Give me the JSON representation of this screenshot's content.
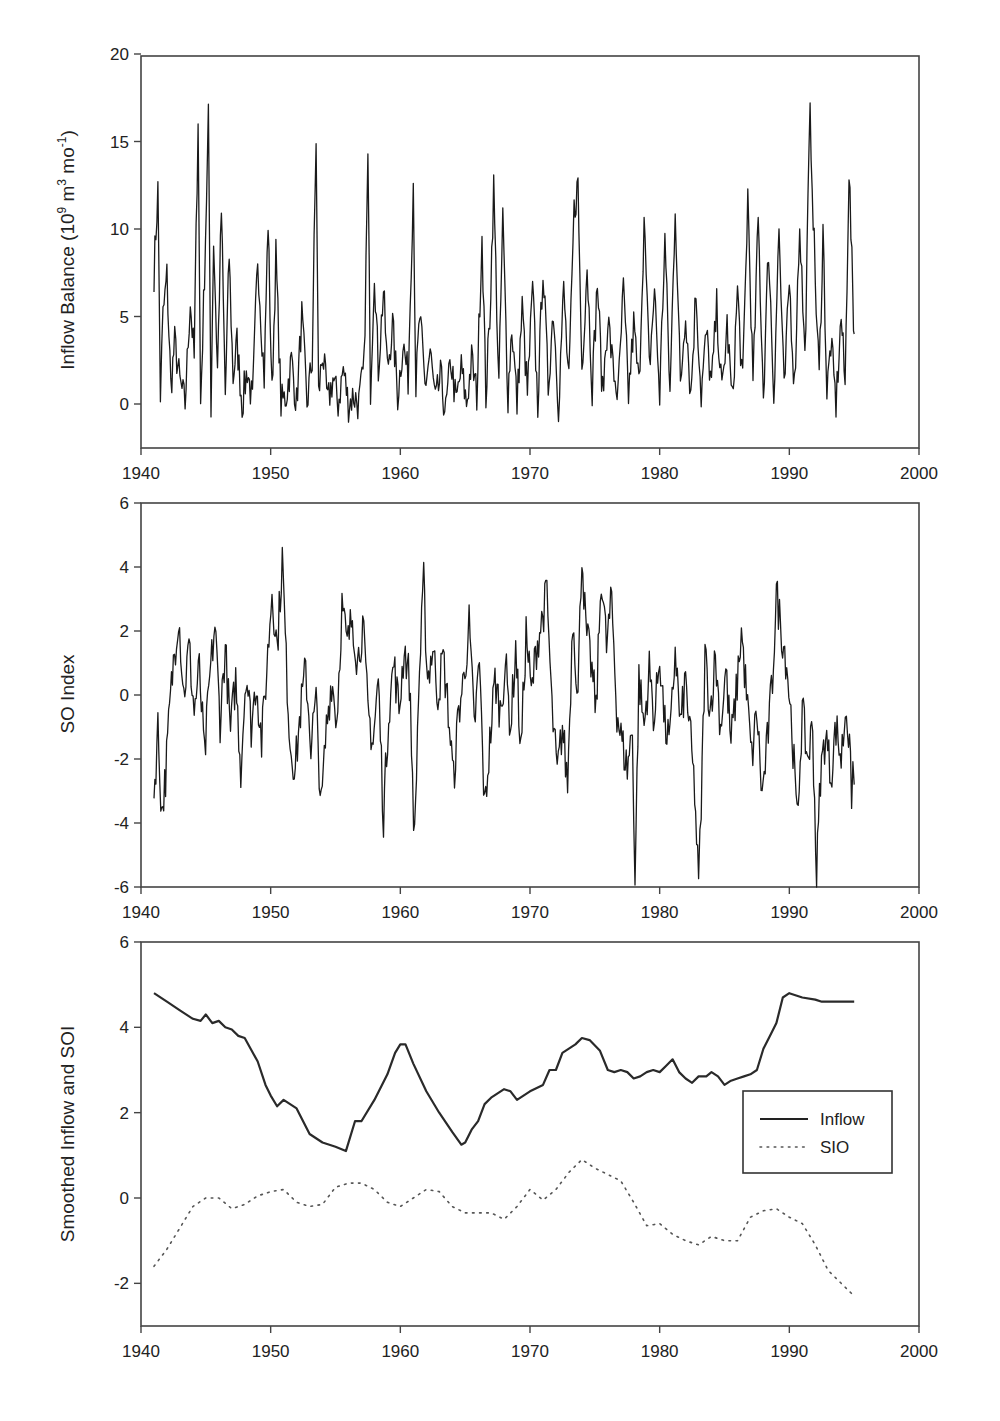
{
  "figure": {
    "panels": [
      {
        "id": "inflow",
        "ylabel": "Inflow Balance (10^9 m^3 mo^-1)",
        "ylabel_parts": {
          "base": "Inflow Balance (10",
          "sup1": "9",
          "mid": " m",
          "sup2": "3",
          "mid2": " mo",
          "sup3": "-1",
          "end": ")"
        },
        "yticks": [
          "20",
          "15",
          "10",
          "5",
          "0"
        ],
        "xticks": [
          "1940",
          "1950",
          "1960",
          "1970",
          "1980",
          "1990",
          "2000"
        ]
      },
      {
        "id": "soi",
        "ylabel": "SO Index",
        "yticks": [
          "6",
          "4",
          "2",
          "0",
          "-2",
          "-4",
          "-6"
        ],
        "xticks": [
          "1940",
          "1950",
          "1960",
          "1970",
          "1980",
          "1990",
          "2000"
        ]
      },
      {
        "id": "smoothed",
        "ylabel": "Smoothed Inflow and SOI",
        "yticks": [
          "6",
          "4",
          "2",
          "0",
          "-2"
        ],
        "xticks": [
          "1940",
          "1950",
          "1960",
          "1970",
          "1980",
          "1990",
          "2000"
        ],
        "legend": {
          "inflow": "Inflow",
          "sio": "SIO"
        }
      }
    ]
  },
  "chart_data": [
    {
      "type": "line",
      "title": "",
      "xlabel": "",
      "ylabel": "Inflow Balance (10^9 m^3 mo^-1)",
      "xlim": [
        1940,
        2000
      ],
      "ylim": [
        -2.5,
        20
      ],
      "grid": false,
      "legend": null,
      "series": [
        {
          "name": "Inflow Balance (monthly, approx. envelope)",
          "x": [
            1941.0,
            1941.3,
            1941.5,
            1941.7,
            1942.0,
            1942.3,
            1942.6,
            1943.0,
            1943.4,
            1943.8,
            1944.1,
            1944.4,
            1944.6,
            1944.9,
            1945.2,
            1945.4,
            1945.6,
            1945.9,
            1946.2,
            1946.5,
            1946.8,
            1947.1,
            1947.4,
            1947.8,
            1948.2,
            1948.6,
            1949.0,
            1949.5,
            1949.8,
            1950.1,
            1950.4,
            1950.8,
            1951.2,
            1951.6,
            1952.0,
            1952.4,
            1952.8,
            1953.2,
            1953.5,
            1953.7,
            1954.0,
            1954.4,
            1954.8,
            1955.2,
            1955.6,
            1956.0,
            1956.4,
            1956.8,
            1957.2,
            1957.5,
            1957.7,
            1958.0,
            1958.3,
            1958.7,
            1959.0,
            1959.4,
            1959.8,
            1960.2,
            1960.6,
            1961.0,
            1961.2,
            1961.5,
            1961.9,
            1962.3,
            1962.7,
            1963.1,
            1963.5,
            1963.9,
            1964.3,
            1964.7,
            1965.1,
            1965.5,
            1965.9,
            1966.3,
            1966.6,
            1966.9,
            1967.2,
            1967.6,
            1967.9,
            1968.3,
            1968.6,
            1969.0,
            1969.4,
            1969.8,
            1970.2,
            1970.6,
            1971.0,
            1971.4,
            1971.8,
            1972.2,
            1972.6,
            1973.0,
            1973.4,
            1973.7,
            1974.0,
            1974.4,
            1974.8,
            1975.2,
            1975.6,
            1976.0,
            1976.4,
            1976.8,
            1977.2,
            1977.6,
            1978.0,
            1978.4,
            1978.8,
            1979.2,
            1979.6,
            1980.0,
            1980.4,
            1980.8,
            1981.2,
            1981.6,
            1982.0,
            1982.4,
            1982.8,
            1983.2,
            1983.6,
            1984.0,
            1984.4,
            1984.8,
            1985.2,
            1985.6,
            1986.0,
            1986.4,
            1986.8,
            1987.2,
            1987.6,
            1988.0,
            1988.4,
            1988.8,
            1989.2,
            1989.6,
            1990.0,
            1990.4,
            1990.8,
            1991.2,
            1991.6,
            1992.0,
            1992.3,
            1992.6,
            1992.9,
            1993.2,
            1993.6,
            1994.0,
            1994.3,
            1994.6,
            1994.9,
            1995.0
          ],
          "values": [
            7.5,
            12.2,
            0.5,
            5.0,
            7.3,
            1.0,
            3.5,
            1.2,
            0.0,
            6.0,
            2.5,
            16.5,
            0.0,
            7.5,
            16.2,
            0.0,
            9.5,
            2.0,
            11.0,
            0.5,
            8.5,
            1.5,
            3.5,
            0.0,
            2.0,
            0.0,
            8.5,
            1.5,
            10.5,
            0.5,
            8.5,
            0.0,
            0.5,
            2.5,
            0.0,
            5.0,
            0.0,
            2.5,
            15.2,
            0.5,
            3.0,
            0.0,
            1.5,
            0.0,
            2.0,
            0.0,
            0.5,
            0.0,
            2.0,
            13.8,
            1.0,
            7.8,
            2.0,
            6.5,
            2.0,
            4.5,
            0.5,
            3.5,
            1.5,
            12.8,
            1.0,
            5.0,
            1.0,
            3.0,
            0.0,
            1.5,
            -0.5,
            2.5,
            0.0,
            2.0,
            0.0,
            2.5,
            0.5,
            9.8,
            0.5,
            5.0,
            12.4,
            1.0,
            10.6,
            0.5,
            4.5,
            0.0,
            5.5,
            0.5,
            6.5,
            0.0,
            8.0,
            1.0,
            5.5,
            0.0,
            6.5,
            1.0,
            11.0,
            12.6,
            2.0,
            8.0,
            1.0,
            7.0,
            0.5,
            5.0,
            2.0,
            0.5,
            6.5,
            0.5,
            4.5,
            1.0,
            10.5,
            2.0,
            6.5,
            0.5,
            9.5,
            0.5,
            11.5,
            1.0,
            5.5,
            0.5,
            6.5,
            0.5,
            4.0,
            1.0,
            5.5,
            0.5,
            4.5,
            0.0,
            6.5,
            1.0,
            12.0,
            1.0,
            10.5,
            0.5,
            9.0,
            0.5,
            10.0,
            0.5,
            7.0,
            1.0,
            10.5,
            2.5,
            16.9,
            7.0,
            1.5,
            10.0,
            0.5,
            3.5,
            0.0,
            5.0,
            1.0,
            13.5,
            6.0,
            4.0
          ]
        }
      ],
      "notes": "Dense monthly series; major peaks ~16.5 (1944.5), ~16.2 (1945.3), ~15.2 (1953.6), ~13.8 (1957.6), ~12.9 (1961.1), ~12.5 (1968), ~12.6 (1973.7), ~16.9 (1992.3), ~13.5 (1994.9); floor near -1 in 1950s-1960s."
    },
    {
      "type": "line",
      "title": "",
      "xlabel": "",
      "ylabel": "SO Index",
      "xlim": [
        1940,
        2000
      ],
      "ylim": [
        -6,
        6
      ],
      "grid": false,
      "legend": null,
      "series": [
        {
          "name": "SO Index (monthly, approx.)",
          "x": [
            1941.0,
            1941.3,
            1941.6,
            1941.9,
            1942.2,
            1942.5,
            1942.9,
            1943.3,
            1943.7,
            1944.1,
            1944.5,
            1944.9,
            1945.3,
            1945.7,
            1946.1,
            1946.5,
            1946.9,
            1947.3,
            1947.7,
            1948.1,
            1948.5,
            1948.9,
            1949.3,
            1949.7,
            1950.1,
            1950.5,
            1950.9,
            1951.2,
            1951.5,
            1951.9,
            1952.3,
            1952.7,
            1953.1,
            1953.5,
            1953.9,
            1954.3,
            1954.7,
            1955.1,
            1955.5,
            1955.9,
            1956.3,
            1956.7,
            1957.1,
            1957.5,
            1957.9,
            1958.3,
            1958.7,
            1959.1,
            1959.5,
            1959.9,
            1960.3,
            1960.7,
            1961.1,
            1961.4,
            1961.8,
            1962.1,
            1962.5,
            1962.9,
            1963.3,
            1963.7,
            1964.1,
            1964.5,
            1964.9,
            1965.3,
            1965.7,
            1966.1,
            1966.5,
            1966.9,
            1967.3,
            1967.7,
            1968.1,
            1968.5,
            1968.9,
            1969.3,
            1969.7,
            1970.1,
            1970.5,
            1970.9,
            1971.3,
            1971.7,
            1972.1,
            1972.5,
            1972.9,
            1973.3,
            1973.7,
            1974.0,
            1974.3,
            1974.7,
            1975.1,
            1975.5,
            1975.9,
            1976.3,
            1976.7,
            1977.1,
            1977.5,
            1977.9,
            1978.1,
            1978.4,
            1978.8,
            1979.2,
            1979.6,
            1980.0,
            1980.4,
            1980.8,
            1981.2,
            1981.6,
            1982.0,
            1982.4,
            1982.7,
            1983.0,
            1983.2,
            1983.5,
            1983.9,
            1984.3,
            1984.7,
            1985.1,
            1985.5,
            1985.9,
            1986.3,
            1986.7,
            1987.1,
            1987.5,
            1987.9,
            1988.3,
            1988.7,
            1989.0,
            1989.4,
            1989.8,
            1990.2,
            1990.6,
            1991.0,
            1991.4,
            1991.8,
            1992.1,
            1992.4,
            1992.8,
            1993.2,
            1993.6,
            1994.0,
            1994.4,
            1994.8,
            1995.0
          ],
          "values": [
            -3.2,
            -1.0,
            -3.7,
            -2.5,
            -0.5,
            1.0,
            2.6,
            0.0,
            1.5,
            -0.5,
            0.8,
            -2.0,
            0.5,
            2.2,
            -0.8,
            1.5,
            -1.2,
            0.5,
            -2.3,
            0.8,
            -1.0,
            0.5,
            -1.5,
            0.8,
            3.3,
            1.5,
            4.3,
            1.0,
            -1.5,
            -2.3,
            -0.5,
            0.8,
            -1.5,
            -0.2,
            -3.6,
            -1.0,
            0.5,
            -0.8,
            2.8,
            1.5,
            2.5,
            1.0,
            2.2,
            -0.5,
            -1.5,
            0.5,
            -3.8,
            -0.5,
            1.0,
            -0.5,
            1.5,
            0.5,
            -4.6,
            0.0,
            3.5,
            0.5,
            1.5,
            0.0,
            1.2,
            -0.5,
            -2.7,
            -0.5,
            0.5,
            2.2,
            -1.0,
            1.0,
            -3.6,
            -1.5,
            0.5,
            -0.5,
            1.0,
            -1.0,
            1.5,
            -1.8,
            2.0,
            0.0,
            1.5,
            2.3,
            3.2,
            -0.5,
            -2.5,
            -1.0,
            -2.8,
            2.5,
            0.0,
            4.6,
            2.0,
            1.0,
            -0.5,
            3.8,
            1.5,
            3.0,
            -0.5,
            -1.5,
            -2.3,
            -1.0,
            -5.8,
            0.5,
            -1.0,
            0.8,
            -0.8,
            1.3,
            -1.0,
            -1.5,
            1.5,
            -1.0,
            0.5,
            -1.5,
            -3.0,
            -6.0,
            -3.5,
            1.3,
            -0.5,
            1.2,
            -1.0,
            0.8,
            -1.5,
            0.0,
            2.0,
            0.0,
            -2.0,
            -0.5,
            -3.2,
            -1.5,
            0.5,
            3.2,
            2.0,
            1.0,
            -1.0,
            -4.0,
            -0.5,
            -2.0,
            -1.0,
            -5.7,
            -2.5,
            -1.2,
            -2.5,
            -1.0,
            -2.0,
            -0.2,
            -3.0,
            -1.5,
            -2.8
          ]
        }
      ],
      "notes": "Extreme lows ~-5.8 (1978.1) and ~-6 (1983.2); highs ~4.3 (1951), ~4.6 (1974), ~3.8 (1975.9), ~3.2 (1989)."
    },
    {
      "type": "line",
      "title": "",
      "xlabel": "",
      "ylabel": "Smoothed Inflow and SOI",
      "xlim": [
        1940,
        2000
      ],
      "ylim": [
        -3,
        6
      ],
      "grid": false,
      "legend": {
        "position": "right-center, inside",
        "entries": [
          "Inflow",
          "SIO"
        ]
      },
      "series": [
        {
          "name": "Inflow",
          "style": "solid",
          "x": [
            1941.0,
            1942.0,
            1943.0,
            1944.0,
            1944.6,
            1945.0,
            1945.5,
            1946.0,
            1946.5,
            1947.0,
            1947.5,
            1948.0,
            1949.0,
            1949.6,
            1950.0,
            1950.5,
            1951.0,
            1952.0,
            1952.5,
            1953.0,
            1954.0,
            1955.0,
            1955.8,
            1956.5,
            1957.0,
            1958.0,
            1959.0,
            1959.6,
            1960.0,
            1960.4,
            1961.0,
            1962.0,
            1963.0,
            1964.0,
            1964.7,
            1965.0,
            1965.5,
            1966.0,
            1966.5,
            1967.0,
            1968.0,
            1968.5,
            1969.0,
            1969.5,
            1970.0,
            1971.0,
            1971.5,
            1972.0,
            1972.5,
            1973.0,
            1973.5,
            1974.0,
            1974.6,
            1975.4,
            1976.0,
            1976.5,
            1977.0,
            1977.5,
            1978.0,
            1978.5,
            1979.0,
            1979.5,
            1980.0,
            1980.5,
            1981.0,
            1981.5,
            1982.0,
            1982.5,
            1983.0,
            1983.6,
            1984.0,
            1984.5,
            1985.0,
            1985.5,
            1986.0,
            1986.5,
            1987.0,
            1987.5,
            1988.0,
            1988.5,
            1989.0,
            1989.5,
            1990.0,
            1991.0,
            1992.0,
            1992.5,
            1993.0,
            1994.0,
            1995.0
          ],
          "values": [
            4.8,
            4.6,
            4.4,
            4.2,
            4.15,
            4.3,
            4.1,
            4.15,
            4.0,
            3.95,
            3.8,
            3.75,
            3.2,
            2.65,
            2.4,
            2.15,
            2.3,
            2.1,
            1.8,
            1.5,
            1.3,
            1.2,
            1.1,
            1.8,
            1.8,
            2.3,
            2.9,
            3.4,
            3.6,
            3.6,
            3.15,
            2.5,
            2.0,
            1.55,
            1.25,
            1.3,
            1.6,
            1.8,
            2.2,
            2.35,
            2.55,
            2.5,
            2.3,
            2.4,
            2.5,
            2.65,
            3.0,
            3.0,
            3.4,
            3.5,
            3.6,
            3.75,
            3.7,
            3.45,
            3.0,
            2.95,
            3.0,
            2.95,
            2.8,
            2.85,
            2.95,
            3.0,
            2.95,
            3.1,
            3.25,
            2.95,
            2.8,
            2.7,
            2.85,
            2.85,
            2.95,
            2.85,
            2.65,
            2.75,
            2.8,
            2.85,
            2.9,
            3.0,
            3.5,
            3.8,
            4.1,
            4.7,
            4.8,
            4.7,
            4.65,
            4.6,
            4.6,
            4.6,
            4.6
          ]
        },
        {
          "name": "SIO",
          "style": "dotted",
          "x": [
            1941.0,
            1942.0,
            1943.0,
            1944.0,
            1945.0,
            1946.0,
            1947.0,
            1948.0,
            1949.0,
            1950.0,
            1951.0,
            1952.0,
            1953.0,
            1954.0,
            1955.0,
            1956.0,
            1957.0,
            1958.0,
            1959.0,
            1960.0,
            1961.0,
            1962.0,
            1963.0,
            1964.0,
            1965.0,
            1966.0,
            1967.0,
            1968.0,
            1969.0,
            1970.0,
            1971.0,
            1972.0,
            1973.0,
            1974.0,
            1975.0,
            1976.0,
            1977.0,
            1978.0,
            1979.0,
            1980.0,
            1981.0,
            1982.0,
            1983.0,
            1984.0,
            1985.0,
            1986.0,
            1987.0,
            1988.0,
            1989.0,
            1990.0,
            1991.0,
            1992.0,
            1993.0,
            1994.0,
            1995.0
          ],
          "values": [
            -1.6,
            -1.2,
            -0.7,
            -0.2,
            0.0,
            0.0,
            -0.25,
            -0.15,
            0.05,
            0.15,
            0.2,
            -0.1,
            -0.2,
            -0.15,
            0.25,
            0.35,
            0.35,
            0.2,
            -0.1,
            -0.2,
            0.0,
            0.2,
            0.15,
            -0.2,
            -0.35,
            -0.35,
            -0.35,
            -0.5,
            -0.2,
            0.2,
            -0.05,
            0.2,
            0.6,
            0.9,
            0.7,
            0.55,
            0.4,
            -0.1,
            -0.65,
            -0.6,
            -0.85,
            -1.0,
            -1.1,
            -0.9,
            -1.0,
            -1.0,
            -0.45,
            -0.3,
            -0.25,
            -0.45,
            -0.6,
            -1.1,
            -1.7,
            -2.0,
            -2.3
          ]
        }
      ]
    }
  ]
}
